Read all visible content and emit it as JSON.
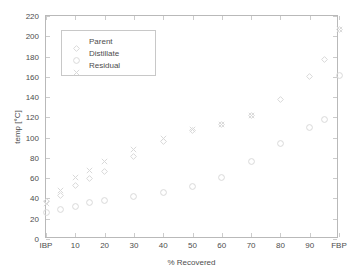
{
  "chart_data": {
    "type": "scatter",
    "title": "",
    "xlabel": "% Recovered",
    "ylabel": "temp [°C]",
    "ylim": [
      0,
      220
    ],
    "ytick_values": [
      0,
      20,
      40,
      60,
      80,
      100,
      120,
      140,
      160,
      180,
      200,
      220
    ],
    "ytick_labels": [
      "0",
      "20",
      "40",
      "60",
      "80",
      "100",
      "120",
      "140",
      "160",
      "180",
      "200",
      "220"
    ],
    "xtick_positions": [
      0,
      10,
      20,
      30,
      40,
      50,
      60,
      70,
      80,
      90,
      100
    ],
    "xtick_labels": [
      "IBP",
      "10",
      "20",
      "30",
      "40",
      "50",
      "60",
      "70",
      "80",
      "90",
      "FBP"
    ],
    "xlim": [
      0,
      100
    ],
    "grid": false,
    "legend_position": "upper-left-inside",
    "marker_color": "#d9d9d9",
    "axis_color": "#b9b9b9",
    "text_color": "#4d4d4d",
    "background": "#ffffff",
    "series": [
      {
        "name": "Parent",
        "marker": "diamond",
        "x": [
          0,
          5,
          10,
          15,
          20,
          30,
          40,
          50,
          60,
          70,
          80,
          90,
          95,
          100
        ],
        "y": [
          37,
          43,
          53,
          60,
          67,
          81,
          96,
          107,
          113,
          122,
          138,
          160,
          177,
          207
        ]
      },
      {
        "name": "Distillate",
        "marker": "circle",
        "x": [
          0,
          5,
          10,
          15,
          20,
          30,
          40,
          50,
          60,
          70,
          80,
          90,
          95,
          100
        ],
        "y": [
          26,
          29,
          32,
          36,
          38,
          42,
          46,
          52,
          61,
          76,
          94,
          110,
          118,
          161
        ]
      },
      {
        "name": "Residual",
        "marker": "x",
        "x": [
          0,
          5,
          10,
          15,
          20,
          30,
          40,
          50,
          60,
          70,
          100
        ],
        "y": [
          35,
          48,
          61,
          68,
          76,
          88,
          99,
          108,
          113,
          122,
          207
        ]
      }
    ]
  },
  "legend": {
    "items": [
      {
        "label": "Parent",
        "marker": "diamond"
      },
      {
        "label": "Distillate",
        "marker": "circle"
      },
      {
        "label": "Residual",
        "marker": "x"
      }
    ]
  }
}
